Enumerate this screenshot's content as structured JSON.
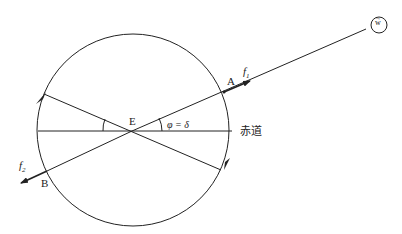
{
  "diagram": {
    "labels": {
      "A": "A",
      "B": "B",
      "E": "E",
      "f1": "f",
      "f1_sub": "1",
      "f2": "f",
      "f2_sub": "2",
      "angle": "φ = δ",
      "equator": "赤道",
      "W": "w"
    },
    "colors": {
      "stroke": "#222222",
      "background": "#ffffff"
    }
  }
}
